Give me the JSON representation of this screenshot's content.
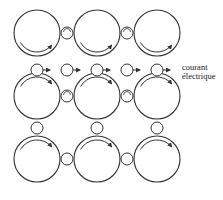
{
  "diagram": {
    "type": "Maxwell molecular vortex model (idle wheels)",
    "colors": {
      "stroke": "#333333",
      "background": "#ffffff"
    },
    "vortex_radius": 23,
    "wheel_radius": 6,
    "vortices": [
      {
        "row": 0,
        "col": 0,
        "cx": 37,
        "cy": 33,
        "arrow": "bottom"
      },
      {
        "row": 0,
        "col": 1,
        "cx": 97,
        "cy": 33,
        "arrow": "bottom"
      },
      {
        "row": 0,
        "col": 2,
        "cx": 157,
        "cy": 33,
        "arrow": "bottom"
      },
      {
        "row": 1,
        "col": 0,
        "cx": 37,
        "cy": 96,
        "arrow": "top"
      },
      {
        "row": 1,
        "col": 1,
        "cx": 97,
        "cy": 96,
        "arrow": "top"
      },
      {
        "row": 1,
        "col": 2,
        "cx": 157,
        "cy": 96,
        "arrow": "top"
      },
      {
        "row": 2,
        "col": 0,
        "cx": 37,
        "cy": 159,
        "arrow": "top"
      },
      {
        "row": 2,
        "col": 1,
        "cx": 97,
        "cy": 159,
        "arrow": "top"
      },
      {
        "row": 2,
        "col": 2,
        "cx": 157,
        "cy": 159,
        "arrow": "top"
      }
    ],
    "idle_wheels": [
      {
        "cx": 67,
        "cy": 33,
        "mark": true
      },
      {
        "cx": 127,
        "cy": 33,
        "mark": true
      },
      {
        "cx": 67,
        "cy": 96,
        "mark": true
      },
      {
        "cx": 127,
        "cy": 96,
        "mark": true
      },
      {
        "cx": 67,
        "cy": 159,
        "mark": false
      },
      {
        "cx": 127,
        "cy": 159,
        "mark": false
      },
      {
        "cx": 37,
        "cy": 128,
        "mark": false
      },
      {
        "cx": 97,
        "cy": 128,
        "mark": false
      },
      {
        "cx": 157,
        "cy": 128,
        "mark": false
      }
    ],
    "current_particles": [
      {
        "cx": 37,
        "cy": 70,
        "arrow": "right"
      },
      {
        "cx": 67,
        "cy": 70,
        "arrow": "right"
      },
      {
        "cx": 97,
        "cy": 70,
        "arrow": "right"
      },
      {
        "cx": 127,
        "cy": 70,
        "arrow": "right"
      },
      {
        "cx": 157,
        "cy": 70,
        "arrow": "right"
      }
    ],
    "label": {
      "line1": "courant",
      "line2": "électrique"
    }
  }
}
